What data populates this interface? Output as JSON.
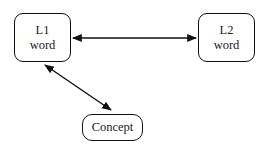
{
  "diagram": {
    "nodes": [
      {
        "id": "l1",
        "lines": [
          "L1",
          "word"
        ]
      },
      {
        "id": "l2",
        "lines": [
          "L2",
          "word"
        ]
      },
      {
        "id": "concept",
        "lines": [
          "Concept"
        ]
      }
    ],
    "edges": [
      {
        "from": "l1",
        "to": "l2",
        "direction": "bidirectional"
      },
      {
        "from": "l1",
        "to": "concept",
        "direction": "bidirectional"
      }
    ],
    "colors": {
      "stroke": "#111111",
      "text": "#222222",
      "background": "#ffffff"
    }
  }
}
